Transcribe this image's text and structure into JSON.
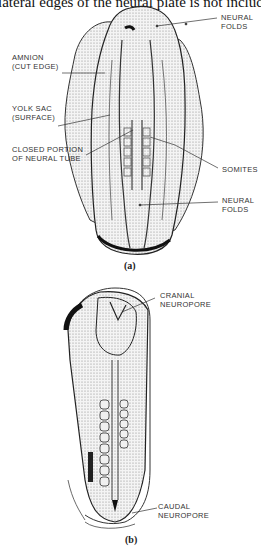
{
  "top_text": "lateral edges of the neural plate is not included",
  "panel_a": {
    "caption": "(a)",
    "labels": {
      "neural_folds_top_1": "NEURAL",
      "neural_folds_top_2": "FOLDS",
      "amnion_1": "AMNION",
      "amnion_2": "(CUT EDGE)",
      "yolk_sac_1": "YOLK SAC",
      "yolk_sac_2": "(SURFACE)",
      "closed_portion_1": "CLOSED PORTION",
      "closed_portion_2": "OF NEURAL TUBE",
      "somites": "SOMITES",
      "neural_folds_bottom_1": "NEURAL",
      "neural_folds_bottom_2": "FOLDS"
    }
  },
  "panel_b": {
    "caption": "(b)",
    "labels": {
      "cranial_1": "CRANIAL",
      "cranial_2": "NEUROPORE",
      "caudal_1": "CAUDAL",
      "caudal_2": "NEUROPORE"
    }
  }
}
